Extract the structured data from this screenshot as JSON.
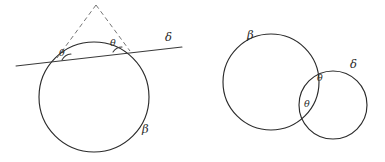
{
  "figure": {
    "caption_type": "geometry-diagram",
    "background_color": "#ffffff",
    "ink_color": "#2b2b2b",
    "dash_color": "#6e6e6e",
    "width": 385,
    "height": 162
  },
  "left_panel": {
    "name": "circle-and-secant-line",
    "circle": {
      "label": "β",
      "center_x": 94,
      "center_y": 97,
      "radius": 55
    },
    "line": {
      "label": "δ",
      "x1": 16,
      "y1": 66,
      "x2": 182,
      "y2": 47
    },
    "dashed_rays": {
      "apex_x": 96,
      "apex_y": 5,
      "left_end_x": 57,
      "left_end_y": 58,
      "right_end_x": 130,
      "right_end_y": 51
    },
    "angle_labels": [
      {
        "text": "θ",
        "x": 59,
        "y": 48
      },
      {
        "text": "θ",
        "x": 110,
        "y": 38
      }
    ],
    "labels": [
      {
        "name": "line-label-delta",
        "text": "δ",
        "x": 165,
        "y": 32
      },
      {
        "name": "circle-label-beta",
        "text": "β",
        "x": 142,
        "y": 124
      }
    ]
  },
  "right_panel": {
    "name": "two-intersecting-circles",
    "big_circle": {
      "label": "β",
      "center_x": 271,
      "center_y": 82,
      "radius": 48
    },
    "small_circle": {
      "label": "δ",
      "center_x": 333,
      "center_y": 105,
      "radius": 34
    },
    "angle_labels": [
      {
        "text": "θ",
        "x": 317,
        "y": 73
      },
      {
        "text": "θ",
        "x": 304,
        "y": 99
      }
    ],
    "labels": [
      {
        "name": "big-circle-label-beta",
        "text": "β",
        "x": 247,
        "y": 30
      },
      {
        "name": "small-circle-label-delta",
        "text": "δ",
        "x": 350,
        "y": 59
      }
    ]
  }
}
